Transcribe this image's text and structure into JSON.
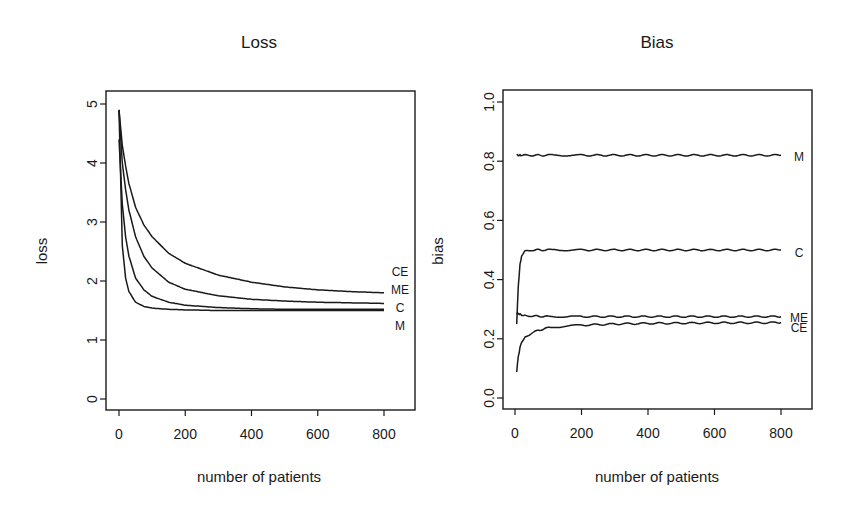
{
  "chart_data": [
    {
      "type": "line",
      "title": "Loss",
      "xlabel": "number of patients",
      "ylabel": "loss",
      "xlim": [
        0,
        800
      ],
      "ylim": [
        0,
        5
      ],
      "xticks": [
        "0",
        "200",
        "400",
        "600",
        "800"
      ],
      "yticks": [
        "0",
        "1",
        "2",
        "3",
        "4",
        "5"
      ],
      "grid": false,
      "legend": "inline labels at right end of lines",
      "x": [
        0,
        10,
        20,
        30,
        50,
        75,
        100,
        150,
        200,
        300,
        400,
        500,
        600,
        700,
        800
      ],
      "series": [
        {
          "name": "CE",
          "values": [
            4.9,
            4.3,
            3.95,
            3.65,
            3.25,
            2.95,
            2.75,
            2.47,
            2.3,
            2.1,
            1.98,
            1.9,
            1.85,
            1.82,
            1.8
          ]
        },
        {
          "name": "ME",
          "values": [
            4.9,
            4.0,
            3.55,
            3.2,
            2.75,
            2.42,
            2.22,
            1.98,
            1.86,
            1.75,
            1.69,
            1.66,
            1.64,
            1.63,
            1.62
          ]
        },
        {
          "name": "C",
          "values": [
            4.4,
            3.3,
            2.75,
            2.42,
            2.05,
            1.85,
            1.74,
            1.64,
            1.59,
            1.55,
            1.53,
            1.52,
            1.52,
            1.52,
            1.52
          ]
        },
        {
          "name": "M",
          "values": [
            4.9,
            2.6,
            2.05,
            1.82,
            1.64,
            1.57,
            1.54,
            1.52,
            1.51,
            1.5,
            1.5,
            1.5,
            1.5,
            1.5,
            1.5
          ]
        }
      ]
    },
    {
      "type": "line",
      "title": "Bias",
      "xlabel": "number of patients",
      "ylabel": "bias",
      "xlim": [
        0,
        800
      ],
      "ylim": [
        0.0,
        1.0
      ],
      "xticks": [
        "0",
        "200",
        "400",
        "600",
        "800"
      ],
      "yticks": [
        "0.0",
        "0.2",
        "0.4",
        "0.6",
        "0.8",
        "1.0"
      ],
      "grid": false,
      "legend": "inline labels at right end of lines",
      "x": [
        5,
        10,
        15,
        20,
        30,
        50,
        75,
        100,
        150,
        200,
        300,
        400,
        500,
        600,
        700,
        800
      ],
      "series": [
        {
          "name": "M",
          "values": [
            0.82,
            0.82,
            0.82,
            0.82,
            0.82,
            0.82,
            0.82,
            0.82,
            0.82,
            0.82,
            0.82,
            0.82,
            0.82,
            0.82,
            0.82,
            0.82
          ]
        },
        {
          "name": "C",
          "values": [
            0.25,
            0.38,
            0.45,
            0.48,
            0.495,
            0.5,
            0.5,
            0.5,
            0.5,
            0.5,
            0.5,
            0.5,
            0.5,
            0.5,
            0.5,
            0.5
          ]
        },
        {
          "name": "ME",
          "values": [
            0.285,
            0.285,
            0.283,
            0.281,
            0.279,
            0.277,
            0.276,
            0.275,
            0.275,
            0.275,
            0.275,
            0.275,
            0.275,
            0.275,
            0.275,
            0.275
          ]
        },
        {
          "name": "CE",
          "values": [
            0.09,
            0.14,
            0.17,
            0.19,
            0.205,
            0.22,
            0.23,
            0.237,
            0.243,
            0.246,
            0.25,
            0.252,
            0.253,
            0.254,
            0.254,
            0.255
          ]
        }
      ]
    }
  ]
}
